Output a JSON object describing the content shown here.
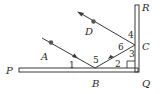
{
  "diagram": {
    "colors": {
      "line": "#3a3a3a",
      "dot": "#555555",
      "background": "#ffffff"
    },
    "points": {
      "P": "P",
      "B": "B",
      "Q": "Q",
      "R": "R",
      "C": "C",
      "A": "A",
      "D": "D"
    },
    "angles": {
      "a1": "1",
      "a2": "2",
      "a3": "3",
      "a4": "4",
      "a5": "5",
      "a6": "6"
    },
    "elements": [
      "horizontal mirror PQ",
      "vertical mirror QR",
      "incident ray A→B",
      "reflected ray B→C",
      "reflected ray C→D",
      "right-angle mark at Q"
    ]
  }
}
